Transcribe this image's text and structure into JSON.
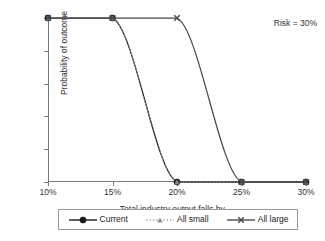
{
  "chart_data": {
    "type": "line",
    "title": "",
    "xlabel": "Total industry output falls by ...",
    "ylabel": "Probability of outcome",
    "x": [
      10,
      15,
      20,
      25,
      30
    ],
    "xtick_labels": [
      "10%",
      "15%",
      "20%",
      "25%",
      "30%"
    ],
    "ytick_labels": [
      "0.0",
      "0.2",
      "0.4",
      "0.6",
      "0.8",
      "1.0"
    ],
    "ytick_values": [
      0.0,
      0.2,
      0.4,
      0.6,
      0.8,
      1.0
    ],
    "xlim": [
      10,
      30
    ],
    "ylim": [
      0.0,
      1.0
    ],
    "grid": false,
    "legend_position": "bottom",
    "annotations": [
      {
        "text": "Risk = 30%",
        "position": "top-right"
      }
    ],
    "series": [
      {
        "name": "Current",
        "marker": "filled-circle",
        "linestyle": "solid",
        "color": "#1a1a1a",
        "values": [
          1.0,
          1.0,
          0.0,
          0.0,
          0.0
        ]
      },
      {
        "name": "All small",
        "marker": "triangle",
        "linestyle": "dotted",
        "color": "#8c8c8c",
        "values": [
          1.0,
          1.0,
          0.0,
          0.0,
          0.0
        ]
      },
      {
        "name": "All large",
        "marker": "x-cross",
        "linestyle": "solid",
        "color": "#4a4a4a",
        "values": [
          1.0,
          1.0,
          1.0,
          0.0,
          0.0
        ]
      }
    ]
  },
  "axes": {
    "x_title": "Total industry output falls by ...",
    "y_title": "Probability of outcome",
    "x_ticks": [
      "10%",
      "15%",
      "20%",
      "25%",
      "30%"
    ],
    "y_ticks": [
      "1.0",
      "0.8",
      "0.6",
      "0.4",
      "0.2",
      "0.0"
    ]
  },
  "annotation": {
    "risk_label": "Risk = 30%"
  },
  "legend": {
    "entries": [
      {
        "label": "Current"
      },
      {
        "label": "All small"
      },
      {
        "label": "All large"
      }
    ]
  },
  "colors": {
    "axis": "#7a7a7a",
    "text": "#333333",
    "current": "#1a1a1a",
    "all_small": "#8c8c8c",
    "all_large": "#4a4a4a",
    "legend_border": "#9a9a9a"
  }
}
